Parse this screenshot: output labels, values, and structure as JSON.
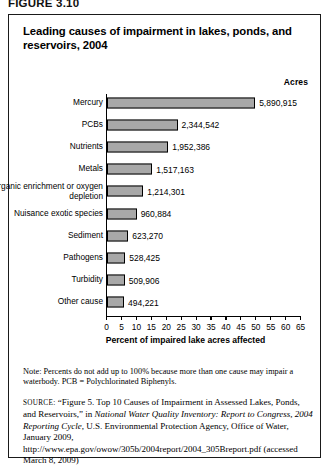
{
  "figure_label": "FIGURE 3.10",
  "chart_title": "Leading causes of impairment in lakes, ponds, and reservoirs, 2004",
  "acres_header": "Acres",
  "note": "Note: Percents do not add up to 100% because more than one cause may impair a waterbody. PCB = Polychlorinated Biphenyls.",
  "source": {
    "label": "SOURCE:",
    "part1": "“Figure 5. Top 10 Causes of Impairment in Assessed Lakes, Ponds, and Reservoirs,” in ",
    "italic1": "National Water Quality Inventory: Report to Congress, 2004 Reporting Cycle",
    "part2": ", U.S. Environmental Protection Agency, Office of Water, January 2009, http://www.epa.gov/owow/305b/2004report/2004_305Breport.pdf (accessed March 8, 2009)"
  },
  "chart_data": {
    "type": "bar",
    "orientation": "horizontal",
    "title": "Leading causes of impairment in lakes, ponds, and reservoirs, 2004",
    "xlabel": "Percent of impaired lake acres affected",
    "ylabel": "",
    "xlim": [
      0,
      65
    ],
    "xticks": [
      0,
      5,
      10,
      15,
      20,
      25,
      30,
      35,
      40,
      45,
      50,
      55,
      60,
      65
    ],
    "grid": false,
    "legend": null,
    "value_column_header": "Acres",
    "bar_color": "#a8a8a8",
    "categories": [
      "Mercury",
      "PCBs",
      "Nutrients",
      "Metals",
      "Organic enrichment or oxygen depletion",
      "Nuisance exotic species",
      "Sediment",
      "Pathogens",
      "Turbidity",
      "Other cause"
    ],
    "values": [
      49.5,
      23.5,
      20.4,
      15.0,
      12.0,
      9.8,
      7.0,
      6.0,
      5.8,
      5.6
    ],
    "acres": [
      "5,890,915",
      "2,344,542",
      "1,952,386",
      "1,517,163",
      "1,214,301",
      "960,884",
      "623,270",
      "528,425",
      "509,906",
      "494,221"
    ],
    "rows": [
      {
        "category": "Mercury",
        "percent": 49.5,
        "acres": "5,890,915"
      },
      {
        "category": "PCBs",
        "percent": 23.5,
        "acres": "2,344,542"
      },
      {
        "category": "Nutrients",
        "percent": 20.4,
        "acres": "1,952,386"
      },
      {
        "category": "Metals",
        "percent": 15.0,
        "acres": "1,517,163"
      },
      {
        "category": "Organic enrichment or oxygen depletion",
        "percent": 12.0,
        "acres": "1,214,301"
      },
      {
        "category": "Nuisance exotic species",
        "percent": 9.8,
        "acres": "960,884"
      },
      {
        "category": "Sediment",
        "percent": 7.0,
        "acres": "623,270"
      },
      {
        "category": "Pathogens",
        "percent": 6.0,
        "acres": "528,425"
      },
      {
        "category": "Turbidity",
        "percent": 5.8,
        "acres": "509,906"
      },
      {
        "category": "Other cause",
        "percent": 5.6,
        "acres": "494,221"
      }
    ]
  }
}
